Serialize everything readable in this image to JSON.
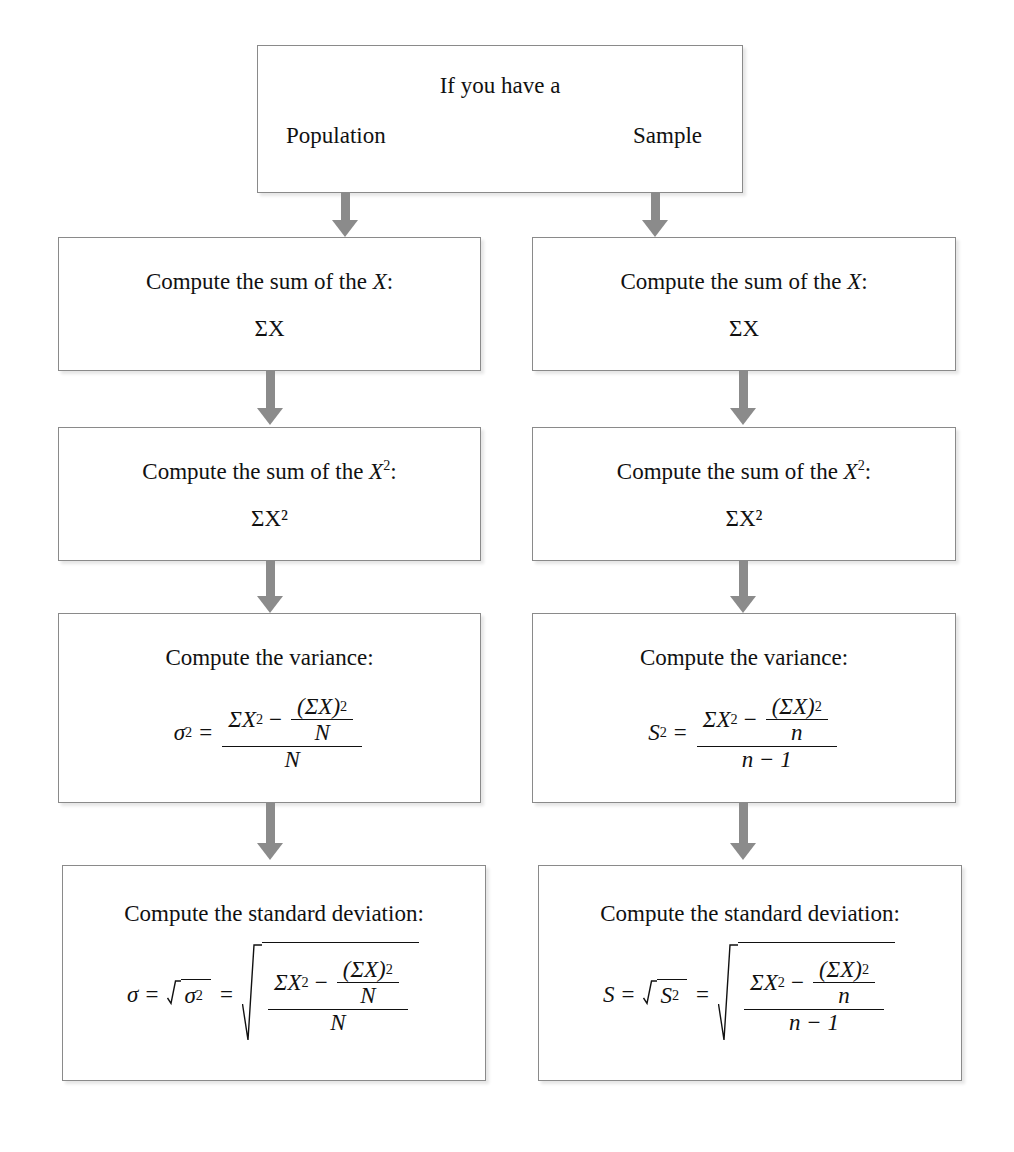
{
  "diagram": {
    "colors": {
      "background": "#ffffff",
      "box_border": "#8a8a8a",
      "arrow": "#8b8b8b",
      "text": "#111111"
    },
    "top_box": {
      "prompt": "If you have a",
      "branch_left": "Population",
      "branch_right": "Sample"
    },
    "columns": [
      {
        "name": "population",
        "steps": [
          {
            "heading": "Compute the sum of the X:",
            "heading_plain": "Compute the sum of the",
            "variable": "X",
            "colon": ":",
            "formula": "ΣX"
          },
          {
            "heading": "Compute the sum of the X²:",
            "heading_plain": "Compute the sum of the",
            "variable": "X",
            "exponent": "2",
            "colon": ":",
            "formula": "ΣX²"
          },
          {
            "heading": "Compute the variance:",
            "formula": "σ² = (ΣX² − (ΣX)²/N) / N",
            "lhs": "σ",
            "lhs_exp": "2",
            "equals": "=",
            "num_first": "ΣX",
            "num_first_exp": "2",
            "minus": "−",
            "inner_num": "(ΣX)",
            "inner_num_exp": "2",
            "inner_den": "N",
            "outer_den": "N"
          },
          {
            "heading": "Compute the standard deviation:",
            "formula": "σ = √σ² = √[(ΣX² − (ΣX)²/N) / N]",
            "lhs": "σ",
            "equals1": "=",
            "radicand1": "σ",
            "radicand1_exp": "2",
            "equals2": "=",
            "num_first": "ΣX",
            "num_first_exp": "2",
            "minus": "−",
            "inner_num": "(ΣX)",
            "inner_num_exp": "2",
            "inner_den": "N",
            "outer_den": "N"
          }
        ]
      },
      {
        "name": "sample",
        "steps": [
          {
            "heading": "Compute the sum of the X:",
            "heading_plain": "Compute the sum of the",
            "variable": "X",
            "colon": ":",
            "formula": "ΣX"
          },
          {
            "heading": "Compute the sum of the X²:",
            "heading_plain": "Compute the sum of the",
            "variable": "X",
            "exponent": "2",
            "colon": ":",
            "formula": "ΣX²"
          },
          {
            "heading": "Compute the variance:",
            "formula": "S² = (ΣX² − (ΣX)²/n) / (n − 1)",
            "lhs": "S",
            "lhs_exp": "2",
            "equals": "=",
            "num_first": "ΣX",
            "num_first_exp": "2",
            "minus": "−",
            "inner_num": "(ΣX)",
            "inner_num_exp": "2",
            "inner_den": "n",
            "outer_den": "n − 1"
          },
          {
            "heading": "Compute the standard deviation:",
            "formula": "S = √S² = √[(ΣX² − (ΣX)²/n) / (n − 1)]",
            "lhs": "S",
            "equals1": "=",
            "radicand1": "S",
            "radicand1_exp": "2",
            "equals2": "=",
            "num_first": "ΣX",
            "num_first_exp": "2",
            "minus": "−",
            "inner_num": "(ΣX)",
            "inner_num_exp": "2",
            "inner_den": "n",
            "outer_den": "n − 1"
          }
        ]
      }
    ]
  }
}
